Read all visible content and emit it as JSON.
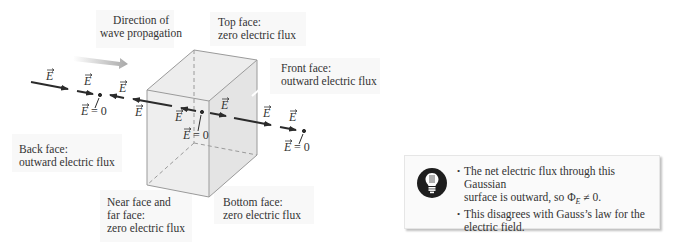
{
  "figure": {
    "wave_direction_label": [
      "Direction of",
      "wave propagation"
    ],
    "face_labels": {
      "top": [
        "Top face:",
        "zero electric flux"
      ],
      "front": [
        "Front face:",
        "outward electric flux"
      ],
      "back": [
        "Back face:",
        "outward electric flux"
      ],
      "near_far": [
        "Near face and",
        "far face:",
        "zero electric flux"
      ],
      "bottom": [
        "Bottom face:",
        "zero electric flux"
      ]
    },
    "field_symbol": "E",
    "field_zero_label": "= 0",
    "colors": {
      "arrow": "#2b2b2b",
      "cube_edge": "#9a9a9a",
      "cube_fill": "#ebebeb",
      "propagation_arrow": "#b9b9b9",
      "label_bg": "#f7f7f7"
    }
  },
  "note": {
    "icon": "lightbulb-icon",
    "bullets": [
      {
        "line1": "The net electric flux through this Gaussian",
        "line2": "surface is outward, so Φ",
        "sub": "E",
        "tail": " ≠ 0."
      },
      {
        "line1": "This disagrees with Gauss’s law for the",
        "line2": "electric field."
      }
    ]
  }
}
